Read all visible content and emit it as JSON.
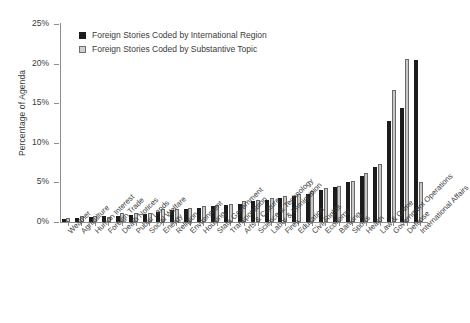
{
  "chart_data": {
    "type": "bar",
    "title": "",
    "subtitle": "",
    "xlabel": "",
    "ylabel": "Percentage of Agenda",
    "ylim": [
      0,
      25
    ],
    "ytick_labels": [
      "0%",
      "5%",
      "10%",
      "15%",
      "20%",
      "25%"
    ],
    "ytick_values": [
      0,
      5,
      10,
      15,
      20,
      25
    ],
    "grid": false,
    "legend_position": "top-left",
    "categories": [
      "Weather",
      "Agriculture",
      "Human Interest",
      "Foreign Trade",
      "Death Notices",
      "Public Lands",
      "Social Welfare",
      "Energy",
      "Religion",
      "Environment",
      "Housing",
      "State Government",
      "Transportation",
      "Arts & Culture",
      "Science & Technology",
      "Labor & Immigration",
      "Fires",
      "Education",
      "Civil Rights",
      "Economy",
      "Banking",
      "Sports",
      "Health",
      "Law & Crime",
      "Government Operations",
      "Defense",
      "International Affairs"
    ],
    "series": [
      {
        "name": "Foreign Stories Coded by International Region",
        "color": "#1c1c1c",
        "values": [
          0.4,
          0.5,
          0.6,
          0.7,
          0.8,
          0.9,
          1.0,
          1.3,
          1.5,
          1.7,
          1.8,
          2.0,
          2.1,
          2.3,
          2.6,
          2.8,
          3.0,
          3.3,
          3.6,
          4.0,
          4.4,
          5.0,
          5.8,
          7.0,
          12.8,
          14.4,
          20.5
        ]
      },
      {
        "name": "Foreign Stories Coded by Substantive Topic",
        "color": "#c8c8c8",
        "values": [
          0.5,
          0.7,
          0.8,
          0.6,
          1.1,
          1.2,
          1.2,
          1.6,
          1.6,
          1.8,
          2.0,
          2.2,
          2.3,
          2.6,
          2.8,
          3.0,
          3.3,
          3.6,
          3.9,
          4.3,
          4.6,
          5.2,
          6.2,
          7.3,
          16.7,
          20.6,
          5.1
        ]
      }
    ]
  },
  "legend": {
    "items": [
      {
        "label": "Foreign Stories Coded by International Region"
      },
      {
        "label": "Foreign Stories Coded by Substantive Topic"
      }
    ]
  }
}
